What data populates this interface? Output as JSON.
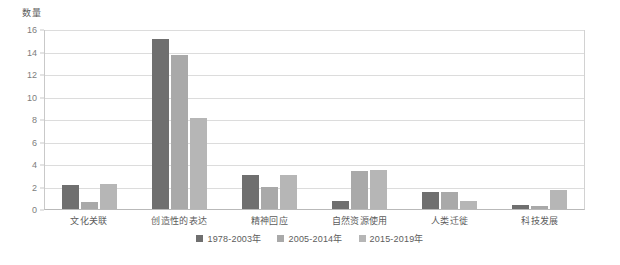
{
  "chart_data": {
    "type": "bar",
    "title": "",
    "xlabel": "",
    "ylabel": "数量",
    "ylim": [
      0,
      16
    ],
    "ytick_step": 2,
    "yticks": [
      "0",
      "2",
      "4",
      "6",
      "8",
      "10",
      "12",
      "14",
      "16"
    ],
    "grid": true,
    "legend_position": "bottom-center",
    "categories": [
      "文化关联",
      "创造性的表达",
      "精神回应",
      "自然资源使用",
      "人类迁徙",
      "科技发展"
    ],
    "series": [
      {
        "name": "1978-2003年",
        "color": "#6f6f6f",
        "values": [
          2.1,
          15.1,
          3.0,
          0.7,
          1.5,
          0.4
        ]
      },
      {
        "name": "2005-2014年",
        "color": "#a9a9a9",
        "values": [
          0.6,
          13.7,
          2.0,
          3.4,
          1.5,
          0.3
        ]
      },
      {
        "name": "2015-2019年",
        "color": "#b6b6b6",
        "values": [
          2.2,
          8.1,
          3.0,
          3.5,
          0.7,
          1.7
        ]
      }
    ]
  }
}
